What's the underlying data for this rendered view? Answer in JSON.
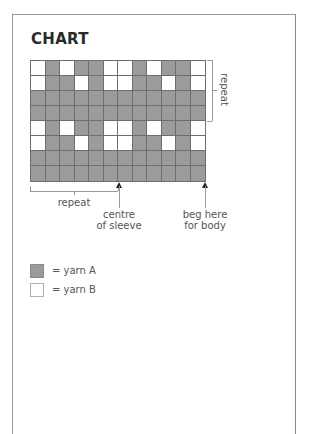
{
  "title": "CHART",
  "colors": {
    "yarn_A": "#9b9b9b",
    "yarn_B": "#ffffff",
    "grid_line": "#6e6e6e"
  },
  "chart_data": {
    "type": "heatmap",
    "title": "CHART",
    "columns": 12,
    "rows": 8,
    "legend": {
      "A": "yarn A",
      "B": "yarn B"
    },
    "grid_top_to_bottom": [
      [
        "B",
        "A",
        "B",
        "A",
        "A",
        "B",
        "B",
        "A",
        "B",
        "A",
        "A",
        "B"
      ],
      [
        "B",
        "A",
        "A",
        "B",
        "A",
        "B",
        "B",
        "A",
        "A",
        "B",
        "A",
        "B"
      ],
      [
        "A",
        "A",
        "A",
        "A",
        "A",
        "A",
        "A",
        "A",
        "A",
        "A",
        "A",
        "A"
      ],
      [
        "A",
        "A",
        "A",
        "A",
        "A",
        "A",
        "A",
        "A",
        "A",
        "A",
        "A",
        "A"
      ],
      [
        "B",
        "A",
        "B",
        "A",
        "A",
        "B",
        "B",
        "A",
        "B",
        "A",
        "A",
        "B"
      ],
      [
        "B",
        "A",
        "A",
        "B",
        "A",
        "B",
        "B",
        "A",
        "A",
        "B",
        "A",
        "B"
      ],
      [
        "A",
        "A",
        "A",
        "A",
        "A",
        "A",
        "A",
        "A",
        "A",
        "A",
        "A",
        "A"
      ],
      [
        "A",
        "A",
        "A",
        "A",
        "A",
        "A",
        "A",
        "A",
        "A",
        "A",
        "A",
        "A"
      ]
    ],
    "annotations": [
      {
        "text": "repeat",
        "type": "vertical-bracket",
        "rows": [
          1,
          4
        ]
      },
      {
        "text": "repeat",
        "type": "horizontal-bracket",
        "columns": [
          1,
          6
        ]
      },
      {
        "text": "centre of sleeve",
        "type": "arrow",
        "column_boundary": 6
      },
      {
        "text": "beg here for body",
        "type": "arrow",
        "column": 12
      }
    ]
  },
  "annotations": {
    "vertical_repeat": "repeat",
    "horizontal_repeat": "repeat",
    "centre_line1": "centre",
    "centre_line2": "of sleeve",
    "beg_line1": "beg here",
    "beg_line2": "for body"
  },
  "legend": [
    {
      "key": "A",
      "label": "= yarn A"
    },
    {
      "key": "B",
      "label": "= yarn B"
    }
  ]
}
